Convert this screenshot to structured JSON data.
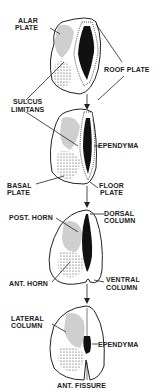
{
  "diagram": {
    "stages": [
      {
        "id": 1,
        "labels": {
          "alar_plate_1": "ALAR",
          "alar_plate_2": "PLATE",
          "roof_plate": "ROOF PLATE",
          "sulcus_limitans_1": "SULCUS",
          "sulcus_limitans_2": "LIMITANS"
        }
      },
      {
        "id": 2,
        "labels": {
          "ependyma": "EPENDYMA",
          "basal_plate_1": "BASAL",
          "basal_plate_2": "PLATE",
          "floor_plate_1": "FLOOR",
          "floor_plate_2": "PLATE"
        }
      },
      {
        "id": 3,
        "labels": {
          "post_horn": "POST. HORN",
          "dorsal_column_1": "DORSAL",
          "dorsal_column_2": "COLUMN",
          "ant_horn": "ANT. HORN",
          "ventral_column_1": "VENTRAL",
          "ventral_column_2": "COLUMN"
        }
      },
      {
        "id": 4,
        "labels": {
          "lateral_column_1": "LATERAL",
          "lateral_column_2": "COLUMN",
          "ependyma": "EPENDYMA",
          "ant_fissure": "ANT. FISSURE"
        }
      }
    ],
    "colors": {
      "ink": "#1a1a1a",
      "light_stipple": "#c8c8c8",
      "dark_stipple": "#8a8a8a",
      "background": "#ffffff"
    }
  }
}
